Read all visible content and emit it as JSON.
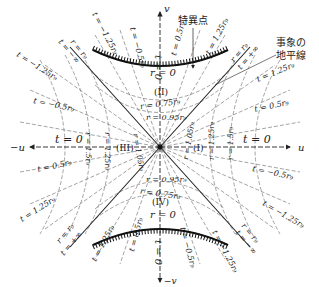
{
  "diagram": {
    "type": "Kruskal-Szekeres spacetime diagram",
    "axes": {
      "u_label": "u",
      "neg_u_label": "−u",
      "v_label": "v",
      "neg_v_label": "−v"
    },
    "annotations": {
      "singularity": "特異点",
      "event_horizon_line1": "事象の",
      "event_horizon_line2": "地平線"
    },
    "regions": {
      "I": "(I)",
      "II": "(II)",
      "III": "(III)",
      "IV": "(IV)"
    },
    "singularity_labels": {
      "top": "r = 0",
      "bottom": "r = 0"
    },
    "t_zero_labels": {
      "right": "t = 0",
      "left": "t = 0",
      "top": "t = 0",
      "bottom": "t = 0"
    },
    "horizon_labels": {
      "top_left_r": "r = r₉",
      "top_left_t": "t = −∞",
      "top_right_r": "r = r₉",
      "top_right_t": "t = +∞",
      "bottom_left_r": "r = r₉",
      "bottom_left_t": "t = +∞",
      "bottom_right_r": "r = r₉",
      "bottom_right_t": "t = −∞"
    },
    "r_labels_region_II": [
      "r = 0.75r₉",
      "r = 0.95r₉"
    ],
    "r_labels_region_IV": [
      "r = 0.95r₉",
      "r = 0.75r₉"
    ],
    "r_labels_region_I": [
      "r = 1.05r₉",
      "r = 1.25r₉",
      "r = 1.5r₉"
    ],
    "r_labels_region_III": [
      "r = 1.05r₉",
      "r = 1.25r₉",
      "r = 1.5r₉"
    ],
    "t_labels": {
      "top_far_left": "t = −1.25r₉",
      "top_left_upper": "t = −1.25r₉",
      "top_left_inner": "t = −0.5r₉",
      "top_right_inner": "t = 0.5r₉",
      "top_right_upper": "t = 1.25r₉",
      "top_far_right": "t = 1.25r₉",
      "left_upper": "t = −0.5r₉",
      "left_lower": "t = 0.5r₉",
      "right_upper": "t = 0.5r₉",
      "right_lower": "t = −0.5r₉",
      "bottom_far_left": "t = 1.25r₉",
      "bottom_left_lower": "t = 1.25r₉",
      "bottom_left_inner": "t = 0.5r₉",
      "bottom_right_inner": "t = −0.5r₉",
      "bottom_right_lower": "t = −1.25r₉",
      "bottom_far_right": "t = −1.25r₉"
    },
    "colors": {
      "line": "#222222",
      "dashed": "#555555",
      "background": "#ffffff"
    }
  }
}
